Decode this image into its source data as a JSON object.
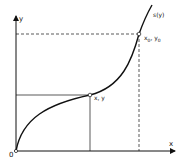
{
  "diagram": {
    "axes": {
      "x_label": "x",
      "y_label": "y",
      "origin_label": "0"
    },
    "curve": {
      "label": "s(y)"
    },
    "points": [
      {
        "name": "general-point",
        "label": "x, y"
      },
      {
        "name": "end-point",
        "label": "x0, y0",
        "main": "x",
        "sub": "0",
        "sep": ", y",
        "sub2": "0"
      }
    ],
    "colors": {
      "line": "#111111",
      "background": "#ffffff"
    }
  }
}
